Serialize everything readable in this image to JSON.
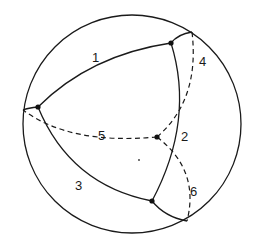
{
  "diagram": {
    "type": "spherical-polyhedron-projection",
    "sphere": {
      "cx": 132,
      "cy": 124,
      "r": 109
    },
    "vertices": [
      {
        "id": "top",
        "x": 171,
        "y": 43
      },
      {
        "id": "left",
        "x": 38,
        "y": 107
      },
      {
        "id": "bottom",
        "x": 152,
        "y": 201
      },
      {
        "id": "back",
        "x": 157,
        "y": 137
      }
    ],
    "edges": [
      {
        "id": "1",
        "label": "1",
        "style": "solid",
        "from": "left",
        "to": "top"
      },
      {
        "id": "2",
        "label": "2",
        "style": "solid",
        "from": "top",
        "to": "bottom"
      },
      {
        "id": "3",
        "label": "3",
        "style": "solid",
        "from": "left",
        "to": "bottom"
      },
      {
        "id": "4",
        "label": "4",
        "style": "dashed",
        "from": "back",
        "to": "rim-top"
      },
      {
        "id": "5",
        "label": "5",
        "style": "dashed",
        "from": "back",
        "to": "rim-left"
      },
      {
        "id": "6",
        "label": "6",
        "style": "dashed",
        "from": "back",
        "to": "rim-bottom"
      }
    ],
    "labels": [
      {
        "text": "1",
        "x": 92,
        "y": 62
      },
      {
        "text": "2",
        "x": 181,
        "y": 141
      },
      {
        "text": "3",
        "x": 75,
        "y": 190
      },
      {
        "text": "4",
        "x": 199,
        "y": 66
      },
      {
        "text": "5",
        "x": 98,
        "y": 140
      },
      {
        "text": "6",
        "x": 190,
        "y": 196
      }
    ],
    "colors": {
      "stroke": "#1a1a1a",
      "background": "#ffffff"
    }
  }
}
